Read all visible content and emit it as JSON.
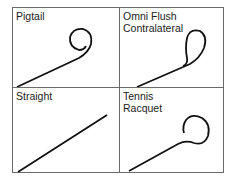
{
  "panels": [
    {
      "id": "pigtail",
      "label_lines": [
        "Pigtail"
      ]
    },
    {
      "id": "omni-flush",
      "label_lines": [
        "Omni Flush",
        "Contralateral"
      ]
    },
    {
      "id": "straight",
      "label_lines": [
        "Straight"
      ]
    },
    {
      "id": "tennis-racquet",
      "label_lines": [
        "Tennis",
        "Racquet"
      ]
    }
  ],
  "colors": {
    "border": "#6a6a6a",
    "line": "#111111",
    "text": "#222222"
  }
}
